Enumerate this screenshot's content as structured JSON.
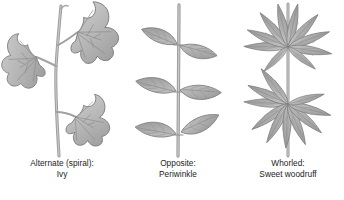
{
  "figure": {
    "style": "grayscale botanical pencil illustration",
    "background_color": "#ffffff",
    "text_color": "#1c1c1c",
    "leaf_fill_color": "#b5b5b5",
    "leaf_edge_color": "#6f6f6f",
    "vein_color": "#8d8d8d",
    "stem_color": "#a8a8a8"
  },
  "panels": [
    {
      "id": "alternate",
      "arrangement_label": "Alternate (spiral):",
      "species_label": "Ivy",
      "leaf_count": 3,
      "leaf_shape": "palmate-lobed",
      "stem_orientation": "vertical, slightly curved"
    },
    {
      "id": "opposite",
      "arrangement_label": "Opposite:",
      "species_label": "Periwinkle",
      "leaf_count": 6,
      "leaf_shape": "elliptic",
      "stem_orientation": "vertical, straight"
    },
    {
      "id": "whorled",
      "arrangement_label": "Whorled:",
      "species_label": "Sweet woodruff",
      "leaf_count": 16,
      "leaf_shape": "lanceolate",
      "stem_orientation": "vertical, straight"
    }
  ],
  "bottom_sliver": {
    "text": ""
  }
}
